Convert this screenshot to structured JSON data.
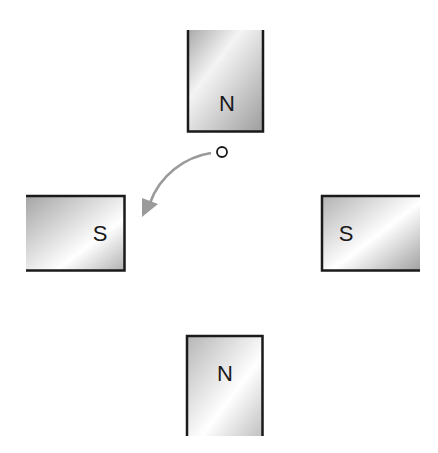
{
  "diagram": {
    "title": "",
    "magnets": [
      {
        "id": "top",
        "label": "N",
        "pole": "north",
        "x": 187,
        "y": 30,
        "w": 77,
        "h": 102,
        "open_side": "top",
        "label_x": 227,
        "label_y": 110
      },
      {
        "id": "left",
        "label": "S",
        "pole": "south",
        "x": 26,
        "y": 195,
        "w": 99,
        "h": 76,
        "open_side": "left",
        "label_x": 100,
        "label_y": 242
      },
      {
        "id": "right",
        "label": "S",
        "pole": "south",
        "x": 321,
        "y": 195,
        "w": 99,
        "h": 76,
        "open_side": "right",
        "label_x": 346,
        "label_y": 242
      },
      {
        "id": "bottom",
        "label": "N",
        "pole": "north",
        "x": 186,
        "y": 335,
        "w": 77,
        "h": 101,
        "open_side": "bottom",
        "label_x": 227,
        "label_y": 381
      }
    ],
    "center_point": {
      "label": "",
      "cx": 222,
      "cy": 152,
      "r": 5
    },
    "arrow": {
      "description": "curved arrow from center point toward left S pole",
      "color": "#9a9a9a"
    },
    "colors": {
      "outline": "#1a1a1a",
      "fill_dark": "#a8a8a8",
      "fill_light": "#ffffff",
      "text": "#1a1a1a"
    }
  }
}
